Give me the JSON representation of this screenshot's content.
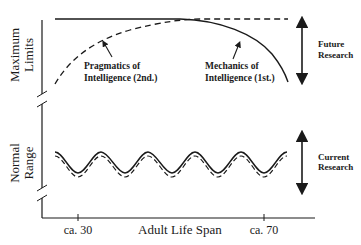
{
  "diagram": {
    "type": "conceptual-lifespan-diagram",
    "y_axis": {
      "upper_section_label_line1": "Maximum",
      "upper_section_label_line2": "Limits",
      "lower_section_label_line1": "Normal",
      "lower_section_label_line2": "Range"
    },
    "x_axis": {
      "label": "Adult Life Span",
      "ticks": [
        {
          "label": "ca. 30"
        },
        {
          "label": "ca. 70"
        }
      ]
    },
    "curves": {
      "pragmatics": {
        "label_line1": "Pragmatics of",
        "label_line2": "Intelligence (2nd.)",
        "style": "dashed"
      },
      "mechanics": {
        "label_line1": "Mechanics of",
        "label_line2": "Intelligence (1st.)",
        "style": "solid"
      },
      "normal_range_wave": {
        "style": "solid with dashed parallel"
      }
    },
    "annotations": {
      "future_research_line1": "Future",
      "future_research_line2": "Research",
      "current_research_line1": "Current",
      "current_research_line2": "Research"
    },
    "colors": {
      "ink": "#1a1a1a",
      "background": "#ffffff"
    }
  }
}
